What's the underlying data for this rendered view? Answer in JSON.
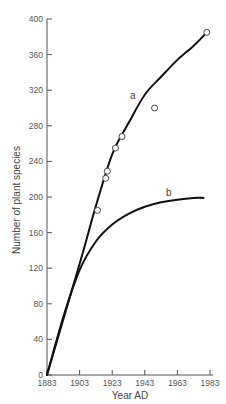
{
  "chart_data": {
    "type": "line",
    "title": "",
    "xlabel": "Year AD",
    "ylabel": "Number of plant species",
    "xlim": [
      1883,
      1983
    ],
    "ylim": [
      0,
      400
    ],
    "x_ticks": [
      1883,
      1903,
      1923,
      1943,
      1963,
      1983
    ],
    "y_ticks": [
      0,
      40,
      80,
      120,
      160,
      200,
      240,
      280,
      320,
      360,
      400
    ],
    "grid": false,
    "legend": null,
    "series": [
      {
        "name": "a",
        "kind": "fitted curve",
        "x": [
          1883,
          1903,
          1913,
          1923,
          1933,
          1943,
          1953,
          1963,
          1973,
          1981
        ],
        "y": [
          0,
          125,
          190,
          248,
          283,
          315,
          335,
          354,
          370,
          385
        ]
      },
      {
        "name": "b",
        "kind": "curve",
        "x": [
          1883,
          1893,
          1903,
          1913,
          1923,
          1933,
          1943,
          1953,
          1963,
          1973,
          1979
        ],
        "y": [
          0,
          65,
          118,
          150,
          169,
          181,
          189,
          194,
          197,
          199,
          199
        ]
      },
      {
        "name": "observations",
        "kind": "scatter (open circles)",
        "x": [
          1914,
          1919,
          1920,
          1925,
          1929,
          1949,
          1981
        ],
        "y": [
          185,
          221,
          229,
          255,
          268,
          300,
          385
        ]
      }
    ],
    "annotations": [
      {
        "text": "a",
        "x": 1935,
        "y": 313
      },
      {
        "text": "b",
        "x": 1958,
        "y": 203
      }
    ]
  },
  "labels": {
    "xlabel": "Year AD",
    "ylabel": "Number of plant species",
    "curve_a": "a",
    "curve_b": "b",
    "x_ticks": [
      "1883",
      "1903",
      "1923",
      "1943",
      "1963",
      "1983"
    ],
    "y_ticks": [
      "0",
      "40",
      "80",
      "120",
      "160",
      "200",
      "240",
      "280",
      "320",
      "360",
      "400"
    ]
  }
}
